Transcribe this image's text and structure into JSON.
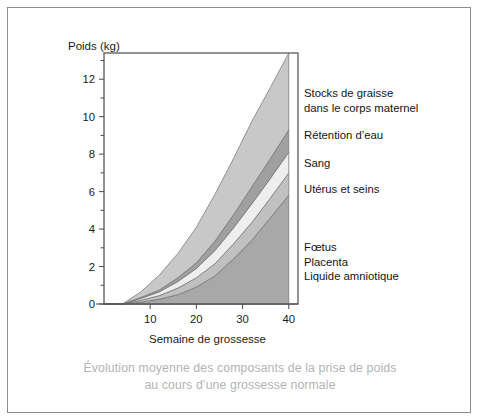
{
  "figure": {
    "caption_line1": "Évolution moyenne des composants de la prise de poids",
    "caption_line2": "au cours d’une grossesse normale",
    "caption_color": "#b3b3b3",
    "border_color": "#8d8d8d",
    "background": "#ffffff"
  },
  "chart_data": {
    "type": "area",
    "title": "",
    "subtitle": "",
    "xlabel": "Semaine de grossesse",
    "ylabel": "Poids (kg)",
    "xlim": [
      0,
      42
    ],
    "ylim": [
      0,
      13.4
    ],
    "grid": false,
    "legend_position": "right",
    "stacked": true,
    "x": [
      0,
      4,
      8,
      12,
      16,
      20,
      24,
      28,
      32,
      36,
      40
    ],
    "xticks": [
      10,
      20,
      30,
      40
    ],
    "xtick_labels": [
      "10",
      "20",
      "30",
      "40"
    ],
    "yticks": [
      0,
      2,
      4,
      6,
      8,
      10,
      12
    ],
    "ytick_labels": [
      "0",
      "2",
      "4",
      "6",
      "8",
      "10",
      "12"
    ],
    "yticks_minor": [
      1,
      3,
      5,
      7,
      9,
      11,
      13
    ],
    "series": [
      {
        "name": "Fœtus, Placenta, Liquide amniotique",
        "legend_label": "Fœtus\nPlacenta\nLiquide amniotique",
        "color": "#a8a8a8",
        "values": [
          0,
          0,
          0.1,
          0.25,
          0.5,
          0.9,
          1.5,
          2.4,
          3.4,
          4.6,
          5.8
        ]
      },
      {
        "name": "Utérus et seins",
        "legend_label": "Utérus et seins",
        "color": "#c0c0c0",
        "values": [
          0,
          0,
          0.1,
          0.2,
          0.35,
          0.5,
          0.65,
          0.8,
          0.95,
          1.05,
          1.2
        ]
      },
      {
        "name": "Sang",
        "legend_label": "Sang",
        "color": "#eeeeee",
        "values": [
          0,
          0,
          0.1,
          0.2,
          0.35,
          0.5,
          0.7,
          0.85,
          1.0,
          1.05,
          1.1
        ]
      },
      {
        "name": "Rétention d’eau",
        "legend_label": "Rétention d’eau",
        "color": "#a0a0a0",
        "values": [
          0,
          0,
          0.05,
          0.1,
          0.2,
          0.3,
          0.5,
          0.7,
          0.9,
          1.05,
          1.2
        ]
      },
      {
        "name": "Stocks de graisse dans le corps maternel",
        "legend_label": "Stocks de graisse\ndans le corps maternel",
        "color": "#c8c8c8",
        "values": [
          0,
          0,
          0.3,
          0.8,
          1.3,
          1.9,
          2.5,
          3.0,
          3.5,
          3.8,
          4.1
        ]
      }
    ],
    "cumulative_top_at_40": [
      5.8,
      7.0,
      8.1,
      9.3,
      13.4
    ],
    "axis_color": "#4a4a4a",
    "outline_color": "#6e6e6e"
  },
  "legend": {
    "fat_line1": "Stocks de graisse",
    "fat_line2": "dans le corps maternel",
    "water": "Rétention d’eau",
    "blood": "Sang",
    "uterus": "Utérus et seins",
    "fetal_line1": "Fœtus",
    "fetal_line2": "Placenta",
    "fetal_line3": "Liquide amniotique"
  },
  "axes": {
    "y_title": "Poids (kg)",
    "x_title": "Semaine de grossesse",
    "y_labels": [
      "12",
      "10",
      "8",
      "6",
      "4",
      "2",
      "0"
    ],
    "x_labels": [
      "10",
      "20",
      "30",
      "40"
    ]
  }
}
